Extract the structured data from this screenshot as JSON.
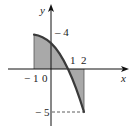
{
  "diagram": {
    "type": "function-graph-shaded-area",
    "function": "f(x) = 3 - 2x - x^2",
    "axes": {
      "x_label": "x",
      "y_label": "y",
      "x_ticks": [
        "-1",
        "0",
        "1",
        "2"
      ],
      "y_ticks": [
        "4",
        "-5"
      ]
    },
    "labels": {
      "x_axis": "x",
      "y_axis": "y",
      "tick_neg1": "− 1",
      "tick_0": "0",
      "tick_1": "1",
      "tick_2": "2",
      "tick_y4": "– 4",
      "tick_yneg5": "− 5"
    },
    "shaded_interval": [
      -1,
      2
    ],
    "points": {
      "start": [
        -1,
        4
      ],
      "y_intercept": [
        0,
        3
      ],
      "root": [
        1,
        0
      ],
      "end": [
        2,
        -5
      ]
    },
    "colors": {
      "curve": "#3a3a3a",
      "shade": "#a9a9a9",
      "axis": "#111111"
    }
  }
}
